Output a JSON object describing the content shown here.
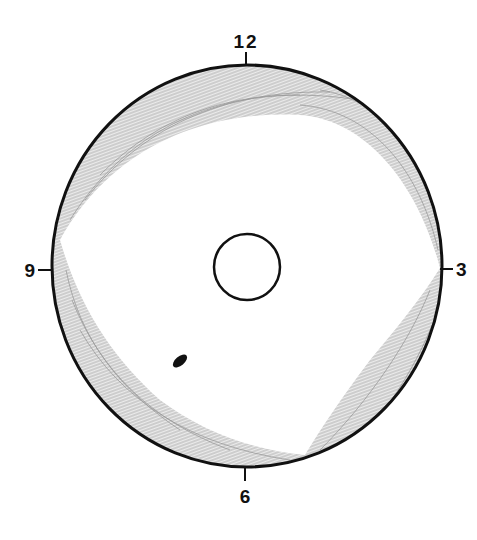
{
  "diagram": {
    "type": "clock-face-diagram",
    "clock_labels": {
      "top": "12",
      "right": "3",
      "bottom": "6",
      "left": "9"
    },
    "colors": {
      "outline": "#111111",
      "shading": "#9a9a9a",
      "lesion": "#111111",
      "background": "#ffffff"
    },
    "elements": [
      "outer-circle",
      "inner-circle",
      "shaded-peripheral-band",
      "dark-spot"
    ]
  }
}
